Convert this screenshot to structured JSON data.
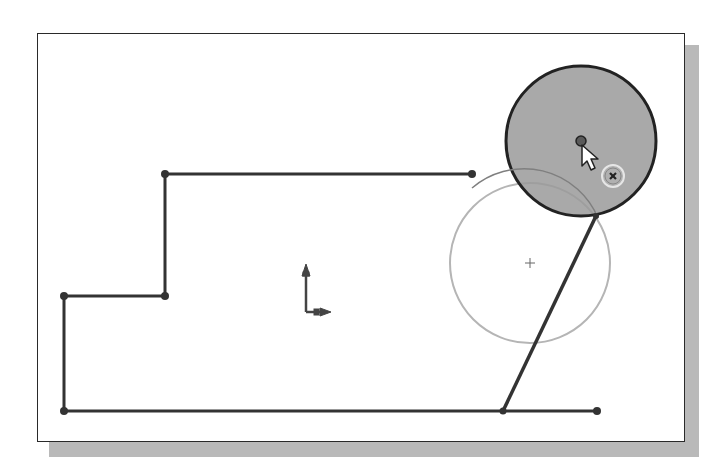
{
  "colors": {
    "line": "#333333",
    "construction_circle": "#b5b5b5",
    "filled_circle": "#9a9a9a",
    "filled_circle_stroke": "#222222",
    "shadow": "#b9b9b9",
    "frame": "#2a2a2a"
  },
  "sketch": {
    "polyline_points": [
      [
        472,
        174
      ],
      [
        165,
        174
      ],
      [
        165,
        296
      ],
      [
        64,
        296
      ],
      [
        64,
        411
      ],
      [
        597,
        411
      ]
    ],
    "endpoints": [
      [
        472,
        174
      ],
      [
        165,
        174
      ],
      [
        165,
        296
      ],
      [
        64,
        296
      ],
      [
        64,
        411
      ],
      [
        597,
        411
      ],
      [
        503,
        411
      ],
      [
        596,
        216
      ]
    ],
    "tangent_line": {
      "from": [
        596,
        216
      ],
      "to": [
        503,
        411
      ]
    },
    "construction_circle": {
      "cx": 530,
      "cy": 263,
      "r": 80
    },
    "filled_circle": {
      "cx": 581,
      "cy": 141,
      "r": 75
    },
    "filled_circle_center": [
      581,
      141
    ],
    "origin": {
      "x": 306,
      "y": 310
    }
  },
  "icons": {
    "cursor": "arrow-pointer-icon",
    "inference": "coincident-inference-icon",
    "origin": "origin-axes-icon",
    "center_mark": "center-plus-icon"
  }
}
